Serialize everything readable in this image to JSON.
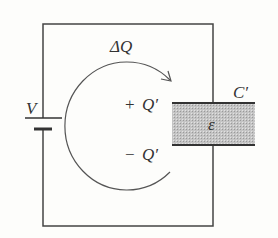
{
  "diagram": {
    "type": "circuit",
    "labels": {
      "voltage": "V",
      "charge_flow": "ΔQ",
      "plus_charge_sign": "+",
      "plus_charge": "Q′",
      "minus_charge_sign": "−",
      "minus_charge": "Q′",
      "capacitor": "C′",
      "dielectric": "ε"
    },
    "colors": {
      "wire": "#444444",
      "dielectric_fill": "#bdbdbd",
      "background": "#fdfdfb"
    }
  }
}
